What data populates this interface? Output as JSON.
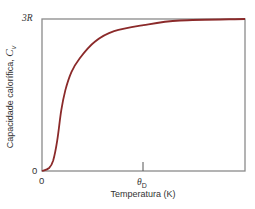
{
  "chart_data": {
    "type": "line",
    "title": "",
    "xlabel": "Temperatura (K)",
    "ylabel": "Capacidade calorífica, C",
    "ylabel_subscript": "v",
    "x_ticks": [
      {
        "label": "0",
        "position": 0
      },
      {
        "label": "θ",
        "subscript": "D",
        "position": 0.5
      }
    ],
    "y_ticks": [
      {
        "label": "0",
        "position": 0
      },
      {
        "label": "3R",
        "position": 1
      }
    ],
    "xlim": [
      0,
      2
    ],
    "ylim": [
      0,
      1
    ],
    "grid": false,
    "legend": null,
    "series": [
      {
        "name": "C_v (Debye)",
        "color": "#8b2a2a",
        "x": [
          0.0,
          0.07,
          0.11,
          0.15,
          0.19,
          0.23,
          0.29,
          0.37,
          0.52,
          0.71,
          1.0,
          1.36,
          2.0
        ],
        "y": [
          0.0,
          0.02,
          0.07,
          0.2,
          0.4,
          0.53,
          0.65,
          0.74,
          0.85,
          0.92,
          0.96,
          0.99,
          1.0
        ]
      }
    ]
  },
  "labels": {
    "y_top": "3R",
    "y_bottom": "0",
    "x_left": "0",
    "x_theta": "θ",
    "x_theta_sub": "D",
    "xlabel": "Temperatura (K)",
    "ylabel_text": "Capacidade calorífica, ",
    "ylabel_symbol": "C",
    "ylabel_sub": "v"
  }
}
